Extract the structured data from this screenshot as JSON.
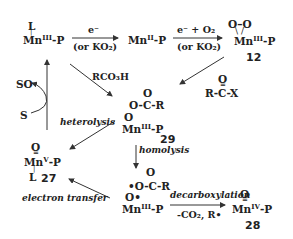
{
  "species": {
    "mn3_L": {
      "ligand": "L",
      "metal": "Mn",
      "ox": "III",
      "suffix": "-P"
    },
    "mn2": {
      "metal": "Mn",
      "ox": "II",
      "suffix": "-P"
    },
    "peroxo_12": {
      "top": "O–O",
      "metal": "Mn",
      "ox": "III",
      "suffix": "-P",
      "label": "12"
    },
    "acyl_29": {
      "carbonyl_o": "O",
      "chain": "O-C-R",
      "link_o": "O",
      "metal": "Mn",
      "ox": "III",
      "suffix": "-P",
      "label": "29"
    },
    "acyl_halide": {
      "carbonyl_o": "O",
      "formula": "R-C-X"
    },
    "radical_pair": {
      "carbonyl_o": "O",
      "chain": "•O-C-R",
      "link_o": "O•",
      "metal": "Mn",
      "ox": "III",
      "suffix": "-P"
    },
    "oxo_mn5_27": {
      "oxo": "O",
      "metal": "Mn",
      "ox": "V",
      "suffix": "-P",
      "ligand": "L",
      "label": "27"
    },
    "oxo_mn4_28": {
      "oxo": "O",
      "metal": "Mn",
      "ox": "IV",
      "suffix": "-P",
      "label": "28"
    },
    "substrate": "S",
    "product": "SO"
  },
  "arrows": {
    "a1": {
      "top": "e⁻",
      "bottom": "(or KO₂)"
    },
    "a2": {
      "top": "e⁻ + O₂",
      "bottom": "(or KO₂)"
    },
    "rco3h": "RCO₃H",
    "heterolysis": "heterolysis",
    "homolysis": "homolysis",
    "electron_transfer": "electron transfer",
    "decarboxylation": {
      "top": "decarboxylation",
      "bottom": "-CO₂, R•"
    }
  }
}
